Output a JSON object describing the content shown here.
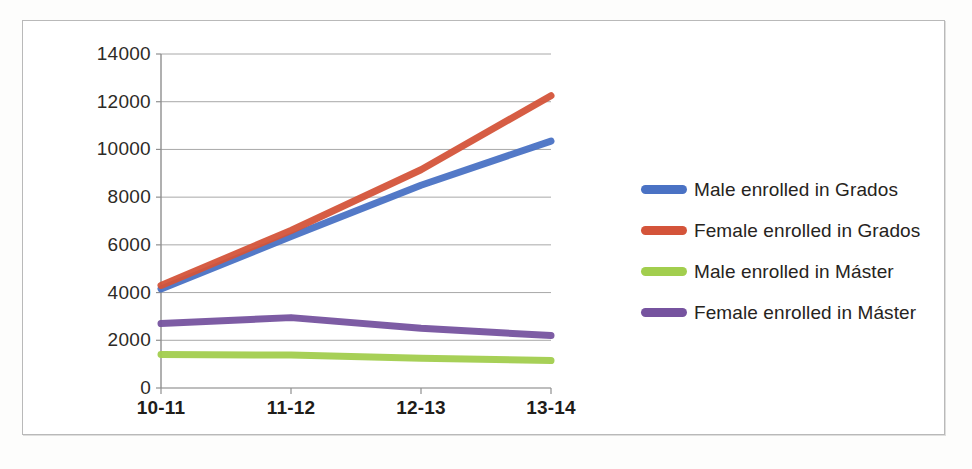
{
  "chart_data": {
    "type": "line",
    "title": "",
    "xlabel": "",
    "ylabel": "",
    "categories": [
      "10-11",
      "11-12",
      "12-13",
      "13-14"
    ],
    "ylim": [
      0,
      14000
    ],
    "yticks": [
      0,
      2000,
      4000,
      6000,
      8000,
      10000,
      12000,
      14000
    ],
    "ytick_labels": [
      "0",
      "2000",
      "4000",
      "6000",
      "8000",
      "10000",
      "12000",
      "14000"
    ],
    "grid": true,
    "legend_position": "right",
    "series": [
      {
        "name": "Male enrolled in Grados",
        "color": "#4a72c4",
        "values": [
          4150,
          6350,
          8500,
          10350
        ]
      },
      {
        "name": "Female enrolled in Grados",
        "color": "#d4543a",
        "values": [
          4300,
          6600,
          9150,
          12250
        ]
      },
      {
        "name": "Male enrolled in Máster",
        "color": "#a2ce4e",
        "values": [
          1400,
          1380,
          1250,
          1150
        ]
      },
      {
        "name": "Female enrolled in Máster",
        "color": "#76539f",
        "values": [
          2700,
          2950,
          2500,
          2200
        ]
      }
    ]
  },
  "legend": {
    "items": [
      {
        "label": "Male enrolled in Grados",
        "color": "#4a72c4"
      },
      {
        "label": "Female enrolled in Grados",
        "color": "#d4543a"
      },
      {
        "label": "Male enrolled in Máster",
        "color": "#a2ce4e"
      },
      {
        "label": "Female enrolled in Máster",
        "color": "#76539f"
      }
    ]
  },
  "colors": {
    "grid": "#a8a8a8",
    "axis": "#8f8f8f",
    "frame": "#b9b9b9",
    "text": "#2d2a26",
    "background": "#ffffff"
  }
}
